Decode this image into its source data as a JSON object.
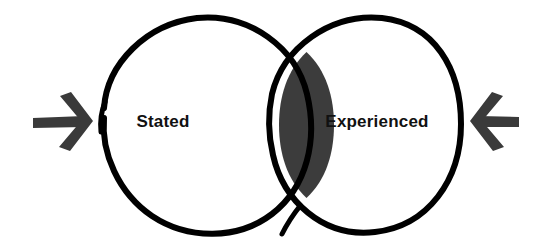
{
  "diagram": {
    "type": "venn",
    "title": "",
    "background_color": "#ffffff",
    "stroke_color": "#000000",
    "intersection_fill": "#3c3c3c",
    "intersection_gap_color": "#ffffff",
    "label_color": "#111111",
    "sets": [
      {
        "id": "stated",
        "label": "Stated",
        "side": "left",
        "fill": "#ffffff",
        "center_x": 205,
        "center_y": 125,
        "radius": 105,
        "label_x": 163,
        "label_y": 123
      },
      {
        "id": "experienced",
        "label": "Experienced",
        "side": "right",
        "fill": "#ffffff",
        "center_x": 358,
        "center_y": 125,
        "radius": 105,
        "label_x": 377,
        "label_y": 123
      }
    ],
    "intersection": {
      "id": "overlap",
      "label": "",
      "fill": "#3c3c3c"
    },
    "arrows": [
      {
        "id": "left-arrow",
        "direction": "right",
        "points_toward": "stated",
        "color": "#3a3a3a",
        "tip_x": 92,
        "tip_y": 122,
        "tail_x": 33,
        "tail_y": 122
      },
      {
        "id": "right-arrow",
        "direction": "left",
        "points_toward": "experienced",
        "color": "#3a3a3a",
        "tip_x": 470,
        "tip_y": 122,
        "tail_x": 520,
        "tail_y": 122
      }
    ]
  }
}
